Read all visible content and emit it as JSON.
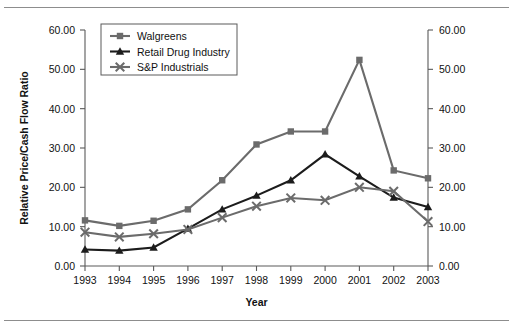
{
  "chart_data": {
    "type": "line",
    "title": "",
    "xlabel": "Year",
    "ylabel": "Relative Price/Cash Flow Ratio",
    "categories": [
      "1993",
      "1994",
      "1995",
      "1996",
      "1997",
      "1998",
      "1999",
      "2000",
      "2001",
      "2002",
      "2003"
    ],
    "x_tick_labels": [
      "1993",
      "1994",
      "1995",
      "1996",
      "1997",
      "1998",
      "1999",
      "2000",
      "2001",
      "2002",
      "2003"
    ],
    "y_tick_labels": [
      "0.00",
      "10.00",
      "20.00",
      "30.00",
      "40.00",
      "50.00",
      "60.00"
    ],
    "y_tick_values": [
      0,
      10,
      20,
      30,
      40,
      50,
      60
    ],
    "ylim": [
      0,
      60
    ],
    "right_axis": {
      "visible": true,
      "tick_labels": [
        "0.00",
        "10.00",
        "20.00",
        "30.00",
        "40.00",
        "50.00",
        "60.00"
      ],
      "tick_values": [
        0,
        10,
        20,
        30,
        40,
        50,
        60
      ],
      "ylim": [
        0,
        60
      ],
      "label": ""
    },
    "grid": false,
    "legend_position": "top-left",
    "series": [
      {
        "name": "Walgreens",
        "marker": "square",
        "color": "#6b6b6b",
        "values": [
          11.6,
          10.2,
          11.5,
          14.4,
          21.8,
          30.9,
          34.2,
          34.2,
          52.4,
          24.3,
          22.3
        ]
      },
      {
        "name": "Retail Drug Industry",
        "marker": "triangle",
        "color": "#1c1c1c",
        "values": [
          4.2,
          3.9,
          4.7,
          9.5,
          14.4,
          17.9,
          21.8,
          28.4,
          22.8,
          17.4,
          15.0
        ]
      },
      {
        "name": "S&P Industrials",
        "marker": "x",
        "color": "#6b6b6b",
        "values": [
          8.6,
          7.4,
          8.2,
          9.3,
          12.3,
          15.2,
          17.3,
          16.7,
          20.0,
          19.0,
          11.3
        ]
      }
    ]
  },
  "legend": {
    "entries": [
      {
        "label": "Walgreens"
      },
      {
        "label": "Retail Drug Industry"
      },
      {
        "label": "S&P Industrials"
      }
    ]
  },
  "axes": {
    "y_title": "Relative Price/Cash Flow Ratio",
    "x_title": "Year"
  }
}
